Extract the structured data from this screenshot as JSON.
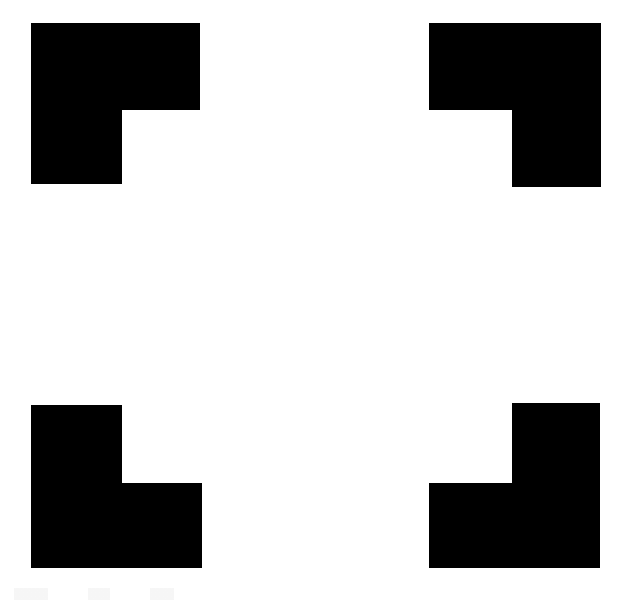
{
  "figure": {
    "name": "Kanizsa square",
    "type": "illusory-contour-figure",
    "width": 623,
    "height": 604,
    "background_color": "#ffffff",
    "inducer_color": "#000000",
    "illusory_surface": {
      "name": "illusory-square",
      "color": "#ffffff",
      "x": 122,
      "y": 110,
      "width": 390,
      "height": 373
    },
    "inducers": [
      {
        "id": "top-left",
        "label": "top-left-inducer",
        "notch_corner": "bottom-right",
        "x": 31,
        "y": 23,
        "width": 169,
        "height": 161,
        "notch_x": 122,
        "notch_y": 110,
        "notch_width": 78,
        "notch_height": 74,
        "points": "31,23 200,23 200,110 122,110 122,184 31,184"
      },
      {
        "id": "top-right",
        "label": "top-right-inducer",
        "notch_corner": "bottom-left",
        "x": 429,
        "y": 23,
        "width": 172,
        "height": 164,
        "notch_x": 429,
        "notch_y": 110,
        "notch_width": 83,
        "notch_height": 77,
        "points": "429,23 601,23 601,187 512,187 512,110 429,110"
      },
      {
        "id": "bottom-left",
        "label": "bottom-left-inducer",
        "notch_corner": "top-right",
        "x": 31,
        "y": 405,
        "width": 171,
        "height": 163,
        "notch_x": 122,
        "notch_y": 405,
        "notch_width": 80,
        "notch_height": 78,
        "points": "31,405 122,405 122,483 202,483 202,568 31,568"
      },
      {
        "id": "bottom-right",
        "label": "bottom-right-inducer",
        "notch_corner": "top-left",
        "x": 429,
        "y": 403,
        "width": 171,
        "height": 165,
        "notch_x": 429,
        "notch_y": 403,
        "notch_width": 83,
        "notch_height": 80,
        "points": "512,403 600,403 600,568 429,568 429,483 512,483"
      }
    ]
  }
}
